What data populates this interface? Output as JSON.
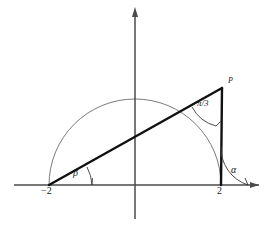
{
  "figure": {
    "type": "geometry-diagram",
    "colors": {
      "axis": "#4a4a4a",
      "circle": "#6b6b6b",
      "triangle": "#111111",
      "arc": "#3a3a3a",
      "text": "#1a1a1a",
      "background": "#ffffff"
    }
  },
  "axes": {
    "x_axis_name": "x-axis",
    "y_axis_name": "y-axis",
    "origin_px": {
      "x": 135,
      "y": 185
    },
    "x_axis_arrow": "right",
    "y_axis_arrow": "up"
  },
  "circle": {
    "name": "semicircle",
    "center_px": {
      "x": 135,
      "y": 185
    },
    "radius_px": 86,
    "span": "upper half"
  },
  "points": {
    "left_vertex": {
      "label": "−2",
      "x_value": -2,
      "px": {
        "x": 49,
        "y": 185
      }
    },
    "right_vertex": {
      "label": "2",
      "x_value": 2,
      "px": {
        "x": 221,
        "y": 185
      }
    },
    "apex": {
      "label": "P",
      "px": {
        "x": 222,
        "y": 88
      }
    }
  },
  "angles": {
    "at_left_vertex": {
      "label": "β",
      "vertex": "−2"
    },
    "at_right_vertex": {
      "label": "α",
      "vertex": "2"
    },
    "at_apex": {
      "numerator": "π",
      "slash": "/",
      "denominator": "3",
      "label": "π/3",
      "vertex": "P"
    }
  },
  "segments": [
    {
      "name": "hypotenuse",
      "from": "−2",
      "to": "P",
      "weight": "thick"
    },
    {
      "name": "vertical-leg",
      "from": "P",
      "to": "2",
      "weight": "thick"
    }
  ]
}
